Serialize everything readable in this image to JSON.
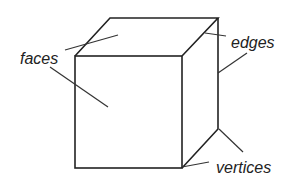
{
  "diagram": {
    "labels": {
      "faces": "faces",
      "edges": "edges",
      "vertices": "vertices"
    },
    "colors": {
      "stroke": "#222222",
      "pointer": "#333333",
      "background": "#ffffff"
    }
  }
}
